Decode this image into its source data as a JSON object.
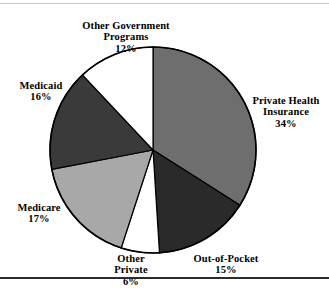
{
  "figure": {
    "background_color": "#ffffff",
    "top_rule_color": "#c9c9c9",
    "bottom_rule_color": "#2b2b2b"
  },
  "chart_data": {
    "type": "pie",
    "title": "",
    "subtitle": "",
    "xlabel": "",
    "ylabel": "",
    "legend_position": "none",
    "grid": false,
    "label_format": "name + percent",
    "start_angle_deg": 0,
    "direction": "clockwise",
    "center": {
      "x": 153,
      "y": 150
    },
    "radius": 103,
    "outline_color": "#000000",
    "categories": [
      "Private Health Insurance",
      "Out-of-Pocket",
      "Other Private",
      "Medicare",
      "Medicaid",
      "Other Government Programs"
    ],
    "values": [
      34,
      15,
      6,
      17,
      16,
      12
    ],
    "slices": [
      {
        "name": "Private Health Insurance",
        "label_lines": "Private Health\nInsurance",
        "value": 34,
        "percent_text": "34%",
        "color": "#6e6e6e"
      },
      {
        "name": "Out-of-Pocket",
        "label_lines": "Out-of-Pocket",
        "value": 15,
        "percent_text": "15%",
        "color": "#2a2a2a"
      },
      {
        "name": "Other Private",
        "label_lines": "Other\nPrivate",
        "value": 6,
        "percent_text": "6%",
        "color": "#ffffff"
      },
      {
        "name": "Medicare",
        "label_lines": "Medicare",
        "value": 17,
        "percent_text": "17%",
        "color": "#a8a8a8"
      },
      {
        "name": "Medicaid",
        "label_lines": "Medicaid",
        "value": 16,
        "percent_text": "16%",
        "color": "#3a3a3a"
      },
      {
        "name": "Other Government Programs",
        "label_lines": "Other Government\nPrograms",
        "value": 12,
        "percent_text": "12%",
        "color": "#ffffff"
      }
    ]
  }
}
